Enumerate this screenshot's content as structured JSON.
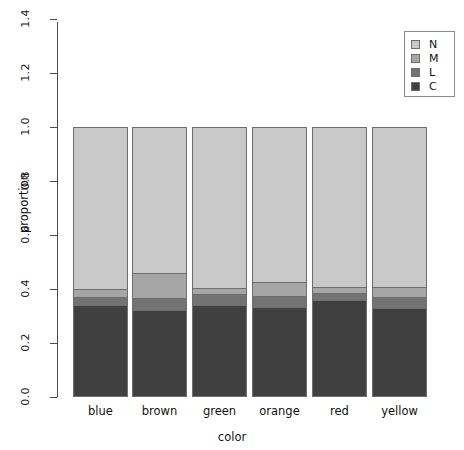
{
  "chart_data": {
    "type": "bar",
    "subtype": "stacked-proportion",
    "title": "",
    "xlabel": "color",
    "ylabel": "proportion",
    "categories": [
      "blue",
      "brown",
      "green",
      "orange",
      "red",
      "yellow"
    ],
    "ylim": [
      0.0,
      1.4
    ],
    "ytick_labels": [
      "0.0",
      "0.2",
      "0.4",
      "0.6",
      "0.8",
      "1.0",
      "1.2",
      "1.4"
    ],
    "ytick_values": [
      0.0,
      0.2,
      0.4,
      0.6,
      0.8,
      1.0,
      1.2,
      1.4
    ],
    "grid": false,
    "legend_position": "top-right",
    "stack_order_bottom_to_top": [
      "C",
      "L",
      "M",
      "N"
    ],
    "series": [
      {
        "name": "C",
        "color": "#404040",
        "values": [
          0.34,
          0.322,
          0.341,
          0.333,
          0.359,
          0.33
        ]
      },
      {
        "name": "L",
        "color": "#737373",
        "values": [
          0.03,
          0.045,
          0.041,
          0.041,
          0.026,
          0.041
        ]
      },
      {
        "name": "M",
        "color": "#a6a6a6",
        "values": [
          0.03,
          0.093,
          0.022,
          0.052,
          0.022,
          0.037
        ]
      },
      {
        "name": "N",
        "color": "#c9c9c9",
        "values": [
          0.6,
          0.54,
          0.596,
          0.574,
          0.593,
          0.592
        ]
      }
    ],
    "legend_entries": [
      {
        "label": "N",
        "color": "#c9c9c9"
      },
      {
        "label": "M",
        "color": "#a6a6a6"
      },
      {
        "label": "L",
        "color": "#737373"
      },
      {
        "label": "C",
        "color": "#404040"
      }
    ],
    "bar_totals": [
      1.0,
      1.0,
      1.0,
      1.0,
      1.0,
      1.0
    ],
    "axis_color": "#4d4d4d",
    "bar_border_color": "#6e6e6e"
  }
}
